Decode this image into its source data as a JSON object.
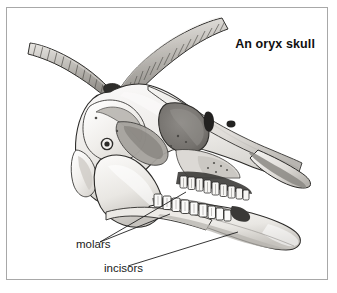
{
  "figure": {
    "title": "An oryx skull",
    "style": "grayscale pen-and-ink shaded illustration",
    "frame": {
      "border_color": "#a8a8a8",
      "background": "#ffffff"
    },
    "palette": {
      "outline": "#2b2b2b",
      "bone_light": "#f4f3f1",
      "bone_mid": "#d8d6d2",
      "shadow_mid": "#a9a7a3",
      "shadow_dark": "#6e6c69",
      "cavity_dark": "#3a3937",
      "horn_light": "#e6e4e0",
      "horn_mid": "#bdbab5",
      "horn_dark": "#84817c",
      "text": "#101010"
    }
  },
  "callouts": [
    {
      "id": "molars",
      "label": "molars",
      "leader_count": 2,
      "points_to": "upper and lower cheek tooth rows"
    },
    {
      "id": "incisors",
      "label": "incisors",
      "leader_count": 1,
      "points_to": "front of lower mandible"
    }
  ],
  "anatomy": {
    "horns": {
      "count": 2,
      "description": "long ringed horns sweeping up and back to the left",
      "ridge_count_upper": 17,
      "ridge_count_lower": 16
    },
    "orbit": "large rounded eye socket in mid skull",
    "teeth": {
      "upper_molars": 9,
      "lower_molars": 9
    },
    "mandible": "lower jaw extending to the right with rounded angle"
  }
}
